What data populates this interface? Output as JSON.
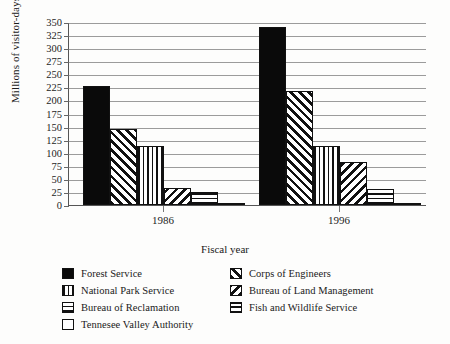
{
  "chart_data": {
    "type": "bar",
    "title": "",
    "xlabel": "Fiscal year",
    "ylabel": "Millions of visitor-days",
    "categories": [
      "1986",
      "1996"
    ],
    "ylim": [
      0,
      350
    ],
    "ytick_step": 25,
    "ytick_labels": [
      "350",
      "325",
      "300",
      "275",
      "250",
      "225",
      "200",
      "175",
      "150",
      "125",
      "100",
      "75",
      "50",
      "25",
      "0"
    ],
    "grid": true,
    "legend_position": "bottom",
    "series": [
      {
        "name": "Forest Service",
        "pattern": "solid",
        "values": [
          227,
          341
        ]
      },
      {
        "name": "National Park Service",
        "pattern": "vertical",
        "values": [
          113,
          112
        ]
      },
      {
        "name": "Bureau of Reclamation",
        "pattern": "horizontal",
        "values": [
          25,
          31
        ]
      },
      {
        "name": "Tennesee Valley Authority",
        "pattern": "empty",
        "values": [
          0,
          0
        ]
      },
      {
        "name": "Corps of Engineers",
        "pattern": "diagonal",
        "values": [
          145,
          219
        ]
      },
      {
        "name": "Bureau of Land Management",
        "pattern": "backdiagonal",
        "values": [
          33,
          83
        ]
      },
      {
        "name": "Fish and Wildlife Service",
        "pattern": "crosshatch",
        "values": [
          3,
          2
        ]
      }
    ],
    "draw_order_1986": [
      "Forest Service",
      "Corps of Engineers",
      "National Park Service",
      "Bureau of Land Management",
      "Bureau of Reclamation",
      "Fish and Wildlife Service"
    ],
    "draw_order_1996": [
      "Forest Service",
      "Corps of Engineers",
      "National Park Service",
      "Bureau of Land Management",
      "Bureau of Reclamation",
      "Fish and Wildlife Service"
    ]
  },
  "axes": {
    "y_title": "Millions of visitor-days",
    "x_title": "Fiscal year",
    "x_tick_labels": [
      "1986",
      "1996"
    ]
  },
  "legend": {
    "left_column": [
      {
        "label": "Forest Service",
        "pattern": "solid"
      },
      {
        "label": "National Park Service",
        "pattern": "vertical"
      },
      {
        "label": "Bureau of Reclamation",
        "pattern": "horizontal"
      },
      {
        "label": "Tennesee Valley Authority",
        "pattern": "empty"
      }
    ],
    "right_column": [
      {
        "label": "Corps of Engineers",
        "pattern": "diagonal"
      },
      {
        "label": "Bureau of Land Management",
        "pattern": "backdiagonal"
      },
      {
        "label": "Fish and Wildlife Service",
        "pattern": "crosshatch"
      }
    ]
  },
  "colors": {
    "ink": "#0a0a0a",
    "grid": "#9b9b9b",
    "axis": "#555555",
    "background": "#fdfdfc"
  }
}
